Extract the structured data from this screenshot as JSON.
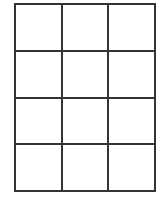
{
  "grid": {
    "rows": 4,
    "columns": 3,
    "line_color": "#333333",
    "background_color": "#ffffff",
    "cells": [
      [
        "",
        "",
        ""
      ],
      [
        "",
        "",
        ""
      ],
      [
        "",
        "",
        ""
      ],
      [
        "",
        "",
        ""
      ]
    ]
  }
}
